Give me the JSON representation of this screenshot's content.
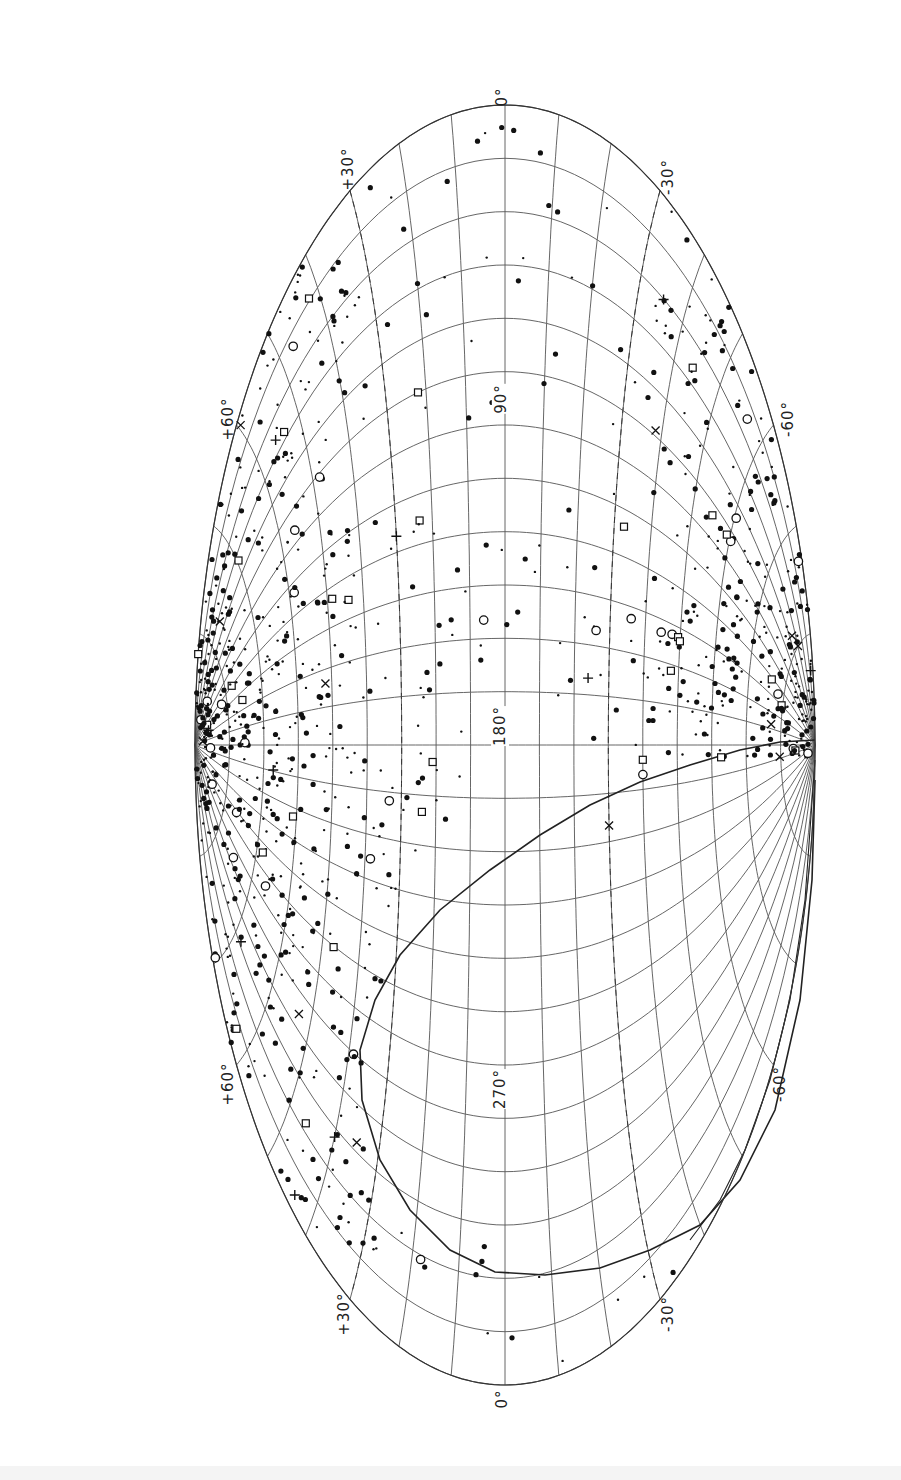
{
  "chart_data": {
    "type": "scatter",
    "projection": "aitoff-galactic",
    "orientation": "rotated-90",
    "title": "",
    "longitude_ticks": [
      "0°",
      "90°",
      "180°",
      "270°",
      "0°"
    ],
    "latitude_ticks": [
      "+30°",
      "+60°",
      "-30°",
      "-60°",
      "+60°",
      "-60°",
      "+30°",
      "-30°"
    ],
    "grid": true,
    "grid_longitude_step_deg": 15,
    "grid_latitude_step_deg": 10,
    "dashed_latitudes_deg": [
      30,
      -30
    ],
    "boundary_curve": "solid declination limit curve in 180°–360° southern region",
    "symbol_types": [
      "filled-dot",
      "small-dot",
      "open-circle",
      "open-square",
      "plus",
      "cross"
    ],
    "series_description": "Object positions concentrated at high galactic latitudes (|b| > 30°), sparse near galactic plane",
    "notable_points": [
      {
        "l": 75,
        "b": 22,
        "symbol": "open-square"
      },
      {
        "l": 115,
        "b": 30,
        "symbol": "plus"
      },
      {
        "l": 185,
        "b": 21,
        "symbol": "open-square"
      },
      {
        "l": 200,
        "b": 24,
        "symbol": "open-square"
      },
      {
        "l": 160,
        "b": -24,
        "symbol": "plus"
      },
      {
        "l": 185,
        "b": -40,
        "symbol": "open-square"
      },
      {
        "l": 190,
        "b": -40,
        "symbol": "open-circle"
      },
      {
        "l": 140,
        "b": -50,
        "symbol": "open-square"
      },
      {
        "l": 205,
        "b": -30,
        "symbol": "cross"
      }
    ]
  },
  "labels": {
    "top_lon": "0°",
    "lon_90": "90°",
    "lon_180": "180°",
    "lon_270": "270°",
    "bottom_lon": "0°",
    "lat_top_left_30": "+30°",
    "lat_top_right_30": "-30°",
    "lat_left_60_a": "+60°",
    "lat_right_60_a": "-60°",
    "lat_left_60_b": "+60°",
    "lat_right_60_b": "-60°",
    "lat_bottom_left_30": "+30°",
    "lat_bottom_right_30": "-30°"
  }
}
